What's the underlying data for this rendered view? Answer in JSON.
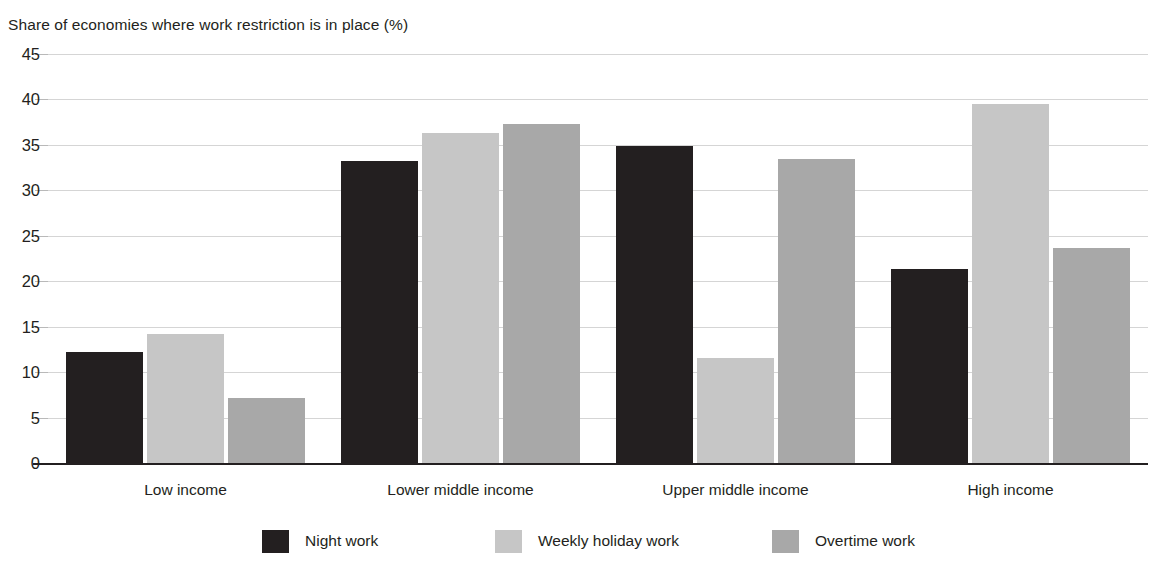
{
  "chart_data": {
    "type": "bar",
    "title": "Share of economies where work restriction is in place (%)",
    "xlabel": "",
    "ylabel": "",
    "ylim": [
      0,
      45
    ],
    "ytick_step": 5,
    "yticks": [
      "45",
      "40",
      "35",
      "30",
      "25",
      "20",
      "15",
      "10",
      "5",
      "0"
    ],
    "grid": true,
    "legend_position": "bottom",
    "categories": [
      "Low income",
      "Lower middle income",
      "Upper middle income",
      "High income"
    ],
    "series": [
      {
        "name": "Night work",
        "color": "#231f20",
        "values": [
          12.2,
          33.2,
          34.9,
          21.4
        ]
      },
      {
        "name": "Weekly holiday work",
        "color": "#c6c6c6",
        "values": [
          14.2,
          36.3,
          11.5,
          39.5
        ]
      },
      {
        "name": "Overtime work",
        "color": "#a8a8a8",
        "values": [
          7.2,
          37.3,
          33.4,
          23.7
        ]
      }
    ]
  },
  "legend": {
    "items": [
      {
        "label": "Night work",
        "swatch": "legend-swatch-night-work"
      },
      {
        "label": "Weekly holiday work",
        "swatch": "legend-swatch-weekly-holiday-work"
      },
      {
        "label": "Overtime work",
        "swatch": "legend-swatch-overtime-work"
      }
    ]
  }
}
